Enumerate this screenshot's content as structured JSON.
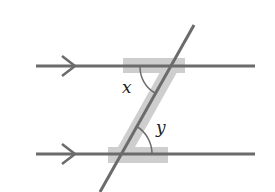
{
  "diagram": {
    "colors": {
      "line": "#6b6b6b",
      "z_highlight": "#c8c8c8",
      "arc": "#6b6b6b",
      "label": "#222222",
      "background": "#ffffff"
    },
    "parallel_lines": [
      {
        "name": "top-line",
        "y": 66,
        "x1": 36,
        "x2": 255,
        "arrow_x": 70
      },
      {
        "name": "bottom-line",
        "y": 154,
        "x1": 36,
        "x2": 255,
        "arrow_x": 70
      }
    ],
    "transversal": {
      "x1": 194,
      "y1": 25,
      "x2": 100,
      "y2": 192
    },
    "angles": [
      {
        "label": "x",
        "vertex": [
          170,
          66
        ],
        "label_pos": [
          124,
          93
        ]
      },
      {
        "label": "y",
        "vertex": [
          120,
          154
        ],
        "label_pos": [
          156,
          133
        ]
      }
    ],
    "z_shape_letter": "Z"
  }
}
